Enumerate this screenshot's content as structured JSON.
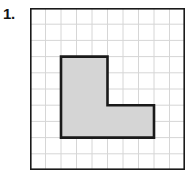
{
  "problem": {
    "number_label": "1."
  },
  "figure": {
    "name": "l-shaped-polygon-on-grid",
    "grid": {
      "columns": 10,
      "rows": 10,
      "cell_width_px": 15.5,
      "cell_height_px": 16.2,
      "origin_x_px": 30,
      "origin_y_px": 8,
      "width_px": 155,
      "height_px": 162,
      "gridline_color": "#d6d6d6",
      "border_color": "#1a1a1a",
      "border_width_px": 1.6,
      "background_color": "#ffffff",
      "show_grid": true
    },
    "shape": {
      "type": "polygon",
      "name": "L-shape",
      "fill_color": "#d5d5d5",
      "stroke_color": "#1a1a1a",
      "stroke_width_px": 2.6,
      "unit_area_squares": 27,
      "vertices_grid": [
        [
          2,
          3
        ],
        [
          5,
          3
        ],
        [
          5,
          6
        ],
        [
          8,
          6
        ],
        [
          8,
          8
        ],
        [
          2,
          8
        ]
      ],
      "vertices_px": [
        [
          32.5,
          47.5
        ],
        [
          79.0,
          47.5
        ],
        [
          79.0,
          96.0
        ],
        [
          125.5,
          96.0
        ],
        [
          125.5,
          128.4
        ],
        [
          32.5,
          128.4
        ]
      ]
    }
  }
}
